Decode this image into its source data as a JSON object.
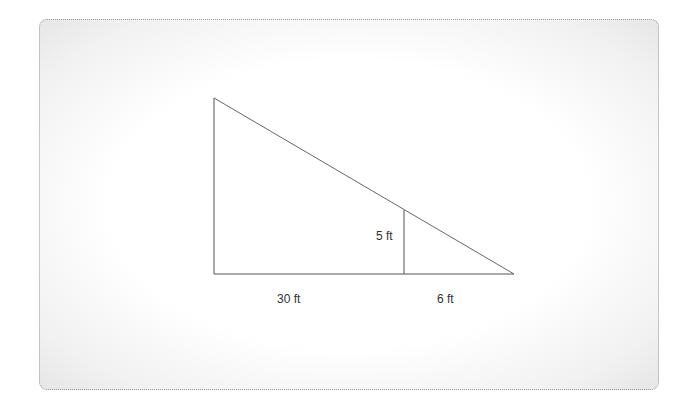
{
  "diagram": {
    "type": "similar-triangles",
    "labels": {
      "post_height": "5 ft",
      "base_left": "30 ft",
      "base_right": "6 ft"
    },
    "colors": {
      "line": "#555555",
      "text": "#333333",
      "card_border": "#9a9a9a"
    }
  }
}
